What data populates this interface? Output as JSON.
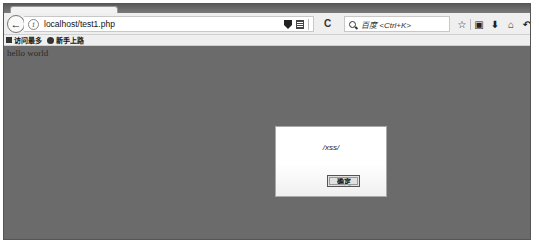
{
  "browser": {
    "url": "localhost/test1.php",
    "search_placeholder": "百度 <Ctrl+K>",
    "icons": {
      "back": "←",
      "info": "i",
      "reload": "C",
      "bookmark_star": "☆",
      "clipboard": "▣",
      "download": "⬇",
      "home": "⌂",
      "undo": "↶"
    }
  },
  "bookmarks": [
    {
      "label": "访问最多",
      "icon": "folder-icon"
    },
    {
      "label": "新手上路",
      "icon": "globe-icon"
    }
  ],
  "page": {
    "body_text": "hello world"
  },
  "alert": {
    "message": "/xss/",
    "ok_label": "确定"
  },
  "colors": {
    "overlay": "#6b6b6b",
    "toolbar": "#efefef",
    "dialog_bg": "#ffffff"
  }
}
